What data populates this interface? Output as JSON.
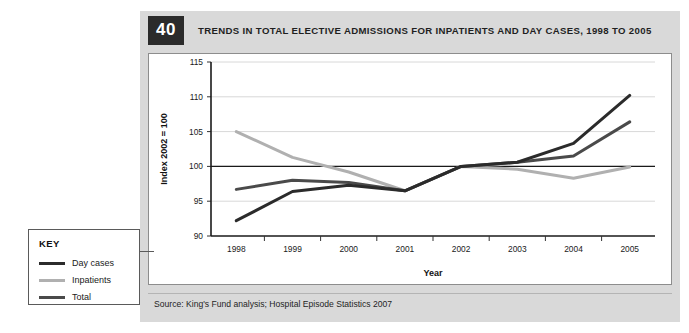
{
  "figure": {
    "number": "40",
    "title": "TRENDS IN TOTAL ELECTIVE ADMISSIONS FOR INPATIENTS AND DAY CASES, 1998 TO 2005",
    "source": "Source: King's Fund analysis; Hospital Episode Statistics 2007"
  },
  "key": {
    "heading": "KEY",
    "items": [
      {
        "label": "Day cases",
        "color": "#2b2b2b"
      },
      {
        "label": "Inpatients",
        "color": "#b0b0b0"
      },
      {
        "label": "Total",
        "color": "#4a4a4a"
      }
    ]
  },
  "chart_data": {
    "type": "line",
    "title": "TRENDS IN TOTAL ELECTIVE ADMISSIONS FOR INPATIENTS AND DAY CASES, 1998 TO 2005",
    "xlabel": "Year",
    "ylabel": "Index 2002 = 100",
    "categories": [
      "1998",
      "1999",
      "2000",
      "2001",
      "2002",
      "2003",
      "2004",
      "2005"
    ],
    "x": [
      1998,
      1999,
      2000,
      2001,
      2002,
      2003,
      2004,
      2005
    ],
    "ylim": [
      90,
      115
    ],
    "yticks": [
      90,
      95,
      100,
      105,
      110,
      115
    ],
    "grid": true,
    "legend_position": "external-left-key-box",
    "reference_line": 100,
    "series": [
      {
        "name": "Day cases",
        "color": "#2b2b2b",
        "values": [
          92.2,
          96.4,
          97.3,
          96.5,
          100.0,
          100.6,
          103.3,
          110.2
        ]
      },
      {
        "name": "Inpatients",
        "color": "#b0b0b0",
        "values": [
          105.0,
          101.3,
          99.2,
          96.5,
          100.0,
          99.6,
          98.3,
          99.9
        ]
      },
      {
        "name": "Total",
        "color": "#4a4a4a",
        "values": [
          96.7,
          98.0,
          97.7,
          96.5,
          100.0,
          100.6,
          101.5,
          106.4
        ]
      }
    ]
  }
}
